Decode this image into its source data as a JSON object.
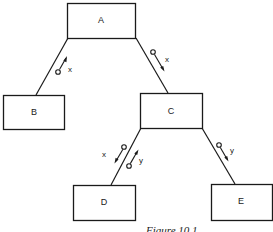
{
  "diagram": {
    "type": "tree",
    "nodes": [
      {
        "id": "A",
        "label": "A"
      },
      {
        "id": "B",
        "label": "B"
      },
      {
        "id": "C",
        "label": "C"
      },
      {
        "id": "D",
        "label": "D"
      },
      {
        "id": "E",
        "label": "E"
      }
    ],
    "edges": [
      {
        "from": "A",
        "to": "B",
        "messages": [
          {
            "label": "x",
            "direction": "up"
          }
        ]
      },
      {
        "from": "A",
        "to": "C",
        "messages": [
          {
            "label": "x",
            "direction": "down"
          }
        ]
      },
      {
        "from": "C",
        "to": "D",
        "messages": [
          {
            "label": "x",
            "direction": "down"
          },
          {
            "label": "y",
            "direction": "up"
          }
        ]
      },
      {
        "from": "C",
        "to": "E",
        "messages": [
          {
            "label": "y",
            "direction": "down"
          }
        ]
      }
    ]
  },
  "caption": "Figure 10.1"
}
